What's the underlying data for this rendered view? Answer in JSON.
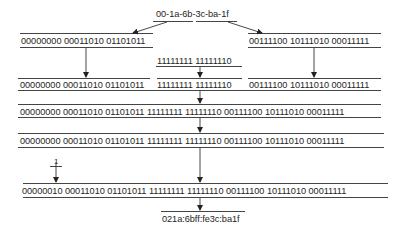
{
  "diagram": {
    "mac_address": "00-1a-6b-3c-ba-1f",
    "step1": {
      "left_bits": "00000000 00011010 01101011",
      "right_bits": "00111100 10111010 00011111"
    },
    "insert_bits": "11111111 11111110",
    "step2": {
      "left_bits": "00000000 00011010 01101011",
      "middle_bits": "11111111 11111110",
      "right_bits": "00111100 10111010 00011111"
    },
    "step3_bits": "00000000 00011010 01101011 11111111 11111110 00111100 10111010 00011111",
    "step4_bits": "00000000 00011010 01101011 11111111 11111110 00111100 10111010 00011111",
    "flip_bit_label": "1",
    "step5_bits": "00000010 00011010 01101011 11111111 11111110 00111100 10111010 00011111",
    "interface_id": "021a:6bff:fe3c:ba1f"
  }
}
